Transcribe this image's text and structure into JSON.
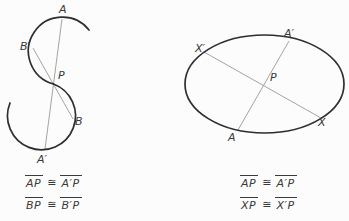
{
  "figure_left": {
    "labels": {
      "a": "A",
      "b_prime": "B′",
      "p": "P",
      "b": "B",
      "a_prime": "A′"
    },
    "statements": [
      {
        "lhs": "AP",
        "rel": "≅",
        "rhs": "A′P"
      },
      {
        "lhs": "BP",
        "rel": "≅",
        "rhs": "B′P"
      }
    ]
  },
  "figure_right": {
    "labels": {
      "x_prime": "X′",
      "a_prime": "A′",
      "p": "P",
      "a": "A",
      "x": "X"
    },
    "statements": [
      {
        "lhs": "AP",
        "rel": "≅",
        "rhs": "A′P"
      },
      {
        "lhs": "XP",
        "rel": "≅",
        "rhs": "X′P"
      }
    ]
  },
  "colors": {
    "curve": "#2e2e2e",
    "chord": "#9a9a9a",
    "text": "#3a3a3a",
    "background": "#fcfcfc"
  }
}
